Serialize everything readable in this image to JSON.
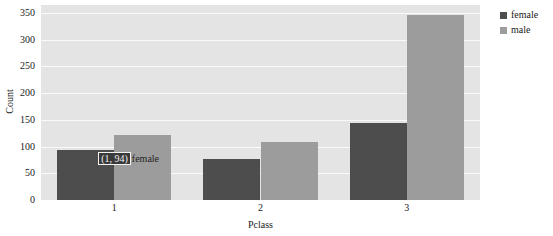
{
  "chart_data": {
    "type": "bar",
    "title": "",
    "xlabel": "Pclass",
    "ylabel": "Count",
    "categories": [
      "1",
      "2",
      "3"
    ],
    "series": [
      {
        "name": "female",
        "color": "#4d4d4d",
        "values": [
          94,
          76,
          144
        ]
      },
      {
        "name": "male",
        "color": "#9c9c9c",
        "values": [
          122,
          108,
          347
        ]
      }
    ],
    "ylim": [
      0,
      365
    ],
    "yticks": [
      0,
      50,
      100,
      150,
      200,
      250,
      300,
      350
    ],
    "ytick_labels": [
      "0",
      "50",
      "100",
      "150",
      "200",
      "250",
      "300",
      "350"
    ],
    "xtick_labels": [
      "1",
      "2",
      "3"
    ],
    "grid": true,
    "grid_color": "#fafafa",
    "plot_background": "#e4e4e4",
    "figure_background": "#ffffff",
    "legend_position": "right",
    "annotations": [
      {
        "coord_text": "(1, 94)",
        "label_text": "female",
        "series": "female",
        "category": "1",
        "value": 94
      }
    ]
  },
  "legend": {
    "items": [
      {
        "label": "female",
        "color": "#4d4d4d"
      },
      {
        "label": "male",
        "color": "#9c9c9c"
      }
    ]
  },
  "axes": {
    "y_title": "Count",
    "x_title": "Pclass"
  },
  "tooltip": {
    "coord": "(1, 94)",
    "label": "female"
  }
}
